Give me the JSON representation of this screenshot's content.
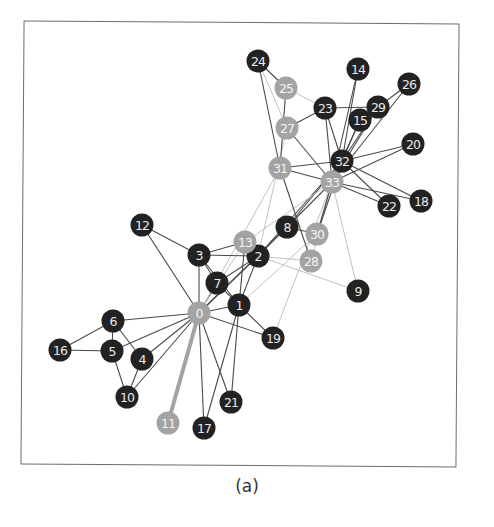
{
  "figure": {
    "caption": "(a)",
    "colors": {
      "dark_node": "#222222",
      "light_node": "#a3a3a3",
      "edge_dark": "#4a4a4a",
      "edge_light": "#c2c2c2",
      "frame": "#6d6d6d"
    }
  },
  "chart_data": {
    "type": "network",
    "title": "(a)",
    "nodes": [
      {
        "id": 0,
        "x": 199,
        "y": 313,
        "group": "light"
      },
      {
        "id": 1,
        "x": 239,
        "y": 305,
        "group": "dark"
      },
      {
        "id": 2,
        "x": 258,
        "y": 256,
        "group": "dark"
      },
      {
        "id": 3,
        "x": 199,
        "y": 255,
        "group": "dark"
      },
      {
        "id": 4,
        "x": 142,
        "y": 359,
        "group": "dark"
      },
      {
        "id": 5,
        "x": 112,
        "y": 351,
        "group": "dark"
      },
      {
        "id": 6,
        "x": 113,
        "y": 321,
        "group": "dark"
      },
      {
        "id": 7,
        "x": 217,
        "y": 283,
        "group": "dark"
      },
      {
        "id": 8,
        "x": 287,
        "y": 227,
        "group": "dark"
      },
      {
        "id": 9,
        "x": 358,
        "y": 291,
        "group": "dark"
      },
      {
        "id": 10,
        "x": 127,
        "y": 397,
        "group": "dark"
      },
      {
        "id": 11,
        "x": 168,
        "y": 423,
        "group": "light"
      },
      {
        "id": 12,
        "x": 142,
        "y": 225,
        "group": "dark"
      },
      {
        "id": 13,
        "x": 245,
        "y": 242,
        "group": "light"
      },
      {
        "id": 14,
        "x": 358,
        "y": 69,
        "group": "dark"
      },
      {
        "id": 15,
        "x": 360,
        "y": 120,
        "group": "dark"
      },
      {
        "id": 16,
        "x": 60,
        "y": 350,
        "group": "dark"
      },
      {
        "id": 17,
        "x": 204,
        "y": 428,
        "group": "dark"
      },
      {
        "id": 18,
        "x": 421,
        "y": 201,
        "group": "dark"
      },
      {
        "id": 19,
        "x": 273,
        "y": 338,
        "group": "dark"
      },
      {
        "id": 20,
        "x": 413,
        "y": 144,
        "group": "dark"
      },
      {
        "id": 21,
        "x": 231,
        "y": 402,
        "group": "dark"
      },
      {
        "id": 22,
        "x": 389,
        "y": 206,
        "group": "dark"
      },
      {
        "id": 23,
        "x": 325,
        "y": 108,
        "group": "dark"
      },
      {
        "id": 24,
        "x": 258,
        "y": 61,
        "group": "dark"
      },
      {
        "id": 25,
        "x": 286,
        "y": 88,
        "group": "light"
      },
      {
        "id": 26,
        "x": 409,
        "y": 84,
        "group": "dark"
      },
      {
        "id": 27,
        "x": 287,
        "y": 128,
        "group": "light"
      },
      {
        "id": 28,
        "x": 311,
        "y": 261,
        "group": "light"
      },
      {
        "id": 29,
        "x": 378,
        "y": 107,
        "group": "dark"
      },
      {
        "id": 30,
        "x": 317,
        "y": 234,
        "group": "light"
      },
      {
        "id": 31,
        "x": 280,
        "y": 168,
        "group": "light"
      },
      {
        "id": 32,
        "x": 342,
        "y": 161,
        "group": "dark"
      },
      {
        "id": 33,
        "x": 332,
        "y": 182,
        "group": "light"
      }
    ],
    "edges": [
      [
        0,
        1,
        "d"
      ],
      [
        0,
        2,
        "d"
      ],
      [
        0,
        3,
        "d"
      ],
      [
        0,
        4,
        "d"
      ],
      [
        0,
        5,
        "d"
      ],
      [
        0,
        6,
        "d"
      ],
      [
        0,
        7,
        "d"
      ],
      [
        0,
        8,
        "d"
      ],
      [
        0,
        10,
        "d"
      ],
      [
        0,
        11,
        "h"
      ],
      [
        0,
        12,
        "d"
      ],
      [
        0,
        13,
        "l"
      ],
      [
        0,
        17,
        "d"
      ],
      [
        0,
        19,
        "d"
      ],
      [
        0,
        21,
        "d"
      ],
      [
        0,
        31,
        "l"
      ],
      [
        1,
        2,
        "d"
      ],
      [
        1,
        3,
        "d"
      ],
      [
        1,
        7,
        "d"
      ],
      [
        1,
        13,
        "d"
      ],
      [
        1,
        17,
        "d"
      ],
      [
        1,
        19,
        "d"
      ],
      [
        1,
        21,
        "d"
      ],
      [
        1,
        30,
        "l"
      ],
      [
        2,
        3,
        "d"
      ],
      [
        2,
        7,
        "d"
      ],
      [
        2,
        8,
        "d"
      ],
      [
        2,
        9,
        "l"
      ],
      [
        2,
        13,
        "d"
      ],
      [
        2,
        27,
        "l"
      ],
      [
        2,
        28,
        "l"
      ],
      [
        2,
        32,
        "d"
      ],
      [
        3,
        7,
        "d"
      ],
      [
        3,
        12,
        "d"
      ],
      [
        3,
        13,
        "d"
      ],
      [
        4,
        6,
        "d"
      ],
      [
        4,
        10,
        "d"
      ],
      [
        5,
        6,
        "d"
      ],
      [
        5,
        10,
        "d"
      ],
      [
        5,
        16,
        "d"
      ],
      [
        6,
        16,
        "d"
      ],
      [
        8,
        30,
        "d"
      ],
      [
        8,
        32,
        "d"
      ],
      [
        8,
        33,
        "d"
      ],
      [
        9,
        33,
        "l"
      ],
      [
        13,
        33,
        "l"
      ],
      [
        14,
        32,
        "d"
      ],
      [
        14,
        33,
        "d"
      ],
      [
        15,
        32,
        "d"
      ],
      [
        15,
        33,
        "d"
      ],
      [
        18,
        32,
        "d"
      ],
      [
        18,
        33,
        "d"
      ],
      [
        19,
        33,
        "l"
      ],
      [
        20,
        32,
        "d"
      ],
      [
        20,
        33,
        "d"
      ],
      [
        22,
        32,
        "d"
      ],
      [
        22,
        33,
        "d"
      ],
      [
        23,
        25,
        "l"
      ],
      [
        23,
        27,
        "d"
      ],
      [
        23,
        29,
        "d"
      ],
      [
        23,
        32,
        "d"
      ],
      [
        23,
        33,
        "d"
      ],
      [
        24,
        25,
        "d"
      ],
      [
        24,
        27,
        "l"
      ],
      [
        24,
        31,
        "d"
      ],
      [
        25,
        31,
        "d"
      ],
      [
        26,
        29,
        "d"
      ],
      [
        26,
        33,
        "d"
      ],
      [
        27,
        33,
        "d"
      ],
      [
        28,
        31,
        "d"
      ],
      [
        28,
        33,
        "l"
      ],
      [
        29,
        32,
        "d"
      ],
      [
        29,
        33,
        "d"
      ],
      [
        30,
        32,
        "d"
      ],
      [
        30,
        33,
        "d"
      ],
      [
        31,
        32,
        "d"
      ],
      [
        31,
        33,
        "d"
      ],
      [
        32,
        33,
        "d"
      ]
    ],
    "legend": [],
    "layout": {
      "frame": [
        22,
        22,
        458,
        466
      ],
      "grid": false
    }
  }
}
